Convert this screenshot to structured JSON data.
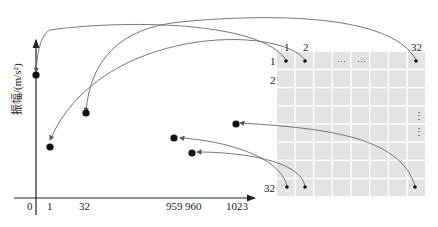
{
  "axis": {
    "y_label": "振幅/(m/s²)",
    "x_ticks": [
      "0",
      "1",
      "32",
      "959",
      "960",
      "1023"
    ]
  },
  "grid": {
    "rows": 8,
    "cols": 8,
    "col_labels": [
      "1",
      "2",
      "32"
    ],
    "row_labels": [
      "1",
      "2",
      "32"
    ],
    "ellipsis_h": "···",
    "ellipsis_v": "⋮",
    "cell_color": "#e3e3e3"
  },
  "points": [
    {
      "index": "0",
      "source": "row1-col1"
    },
    {
      "index": "1",
      "source": "row1-col2"
    },
    {
      "index": "32",
      "source": "row1-col32"
    },
    {
      "index": "959",
      "source": "row32-col1"
    },
    {
      "index": "960",
      "source": "row32-col2"
    },
    {
      "index": "1023",
      "source": "row32-col32"
    }
  ]
}
